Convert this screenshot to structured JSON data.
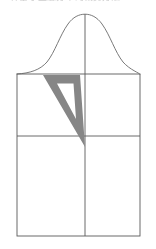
{
  "page": {
    "width": 156,
    "height": 249,
    "background": "#ffffff"
  },
  "header": {
    "clipped_text": "一种基于正态分布的裁剪方法",
    "note": "faint partially-cropped text line at top edge"
  },
  "figure": {
    "name": "bell-curve-over-rectangle-with-triangle",
    "colors": {
      "stroke": "#5a5a5a",
      "curve_stroke": "#6b6b6b",
      "triangle_fill": "#868686",
      "background": "#ffffff"
    },
    "stroke_width": 0.9,
    "rectangle": {
      "left": 17,
      "top": 74,
      "right": 140,
      "bottom": 236
    },
    "vertical_center_line": {
      "x": 85,
      "y_top": 14,
      "y_bottom": 236
    },
    "horizontal_mid_line": {
      "y": 136,
      "x_left": 17,
      "x_right": 140
    },
    "bell_curve": {
      "peak_x": 85,
      "peak_y": 14,
      "baseline_y": 74,
      "left_x": 17,
      "right_x": 140,
      "description": "normal distribution curve meeting the rectangle top edge"
    },
    "triangle_outline": {
      "outer": [
        [
          43,
          75
        ],
        [
          80,
          75
        ],
        [
          85,
          147
        ]
      ],
      "inner": [
        [
          56,
          83
        ],
        [
          74,
          83
        ],
        [
          76,
          118
        ]
      ],
      "description": "hollow gray right-leaning triangle overlay"
    }
  }
}
